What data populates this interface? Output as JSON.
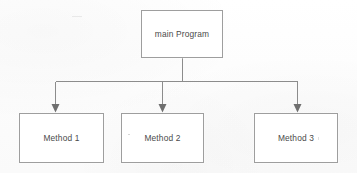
{
  "diagram": {
    "type": "hierarchy-tree",
    "background_color": "#fdfdfd",
    "line_color": "#8c8c8c",
    "border_color": "#9e9e9e",
    "text_color": "#4a4a4a",
    "nodes": [
      {
        "id": "main",
        "label": "main Program",
        "level": 0,
        "x": 141,
        "y": 10,
        "width": 82,
        "height": 48
      },
      {
        "id": "method1",
        "label": "Method 1",
        "level": 1,
        "x": 19,
        "y": 113,
        "width": 85,
        "height": 50
      },
      {
        "id": "method2",
        "label": "Method 2",
        "level": 1,
        "x": 121,
        "y": 113,
        "width": 83,
        "height": 50
      },
      {
        "id": "method3",
        "label": "Method 3",
        "level": 1,
        "x": 254,
        "y": 113,
        "width": 84,
        "height": 50
      }
    ],
    "edges": [
      {
        "id": "edge-main-method1",
        "from": "main",
        "to": "method1",
        "arrow": "down"
      },
      {
        "id": "edge-main-method2",
        "from": "main",
        "to": "method2",
        "arrow": "down"
      },
      {
        "id": "edge-main-method3",
        "from": "main",
        "to": "method3",
        "arrow": "down"
      }
    ],
    "geometry": {
      "stem_x": 182,
      "stem_top": 58,
      "bus_y": 81,
      "bus_left": 55,
      "bus_right": 297,
      "drop_xs": [
        55,
        162,
        297
      ],
      "drop_bottom": 112
    }
  }
}
